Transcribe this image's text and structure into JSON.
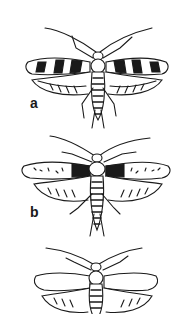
{
  "figure": {
    "panels": [
      {
        "label": "a",
        "wing_pattern": "dark banded forewings with light spots"
      },
      {
        "label": "b",
        "wing_pattern": "speckled forewings with dark central band"
      },
      {
        "label": "c",
        "wing_pattern": "pale outlined wings (cropped)"
      }
    ],
    "colors": {
      "ink": "#1a1a1a",
      "paper": "#ffffff"
    }
  }
}
